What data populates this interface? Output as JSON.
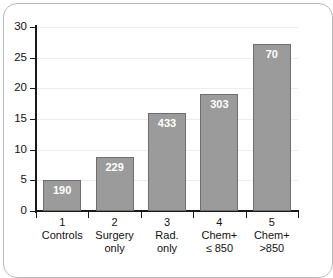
{
  "chart_data": {
    "type": "bar",
    "title": "",
    "subtitle": "",
    "xlabel": "",
    "ylabel": "",
    "ylim": [
      0,
      30
    ],
    "ytick_values": [
      0,
      5,
      10,
      15,
      20,
      25,
      30
    ],
    "ytick_labels": [
      "0",
      "5",
      "10",
      "15",
      "20",
      "25",
      "30"
    ],
    "grid": true,
    "legend": null,
    "categories": [
      {
        "number": "1",
        "line1": "Controls",
        "line2": ""
      },
      {
        "number": "2",
        "line1": "Surgery",
        "line2": "only"
      },
      {
        "number": "3",
        "line1": "Rad.",
        "line2": "only"
      },
      {
        "number": "4",
        "line1": "Chem+",
        "line2": "≤ 850"
      },
      {
        "number": "5",
        "line1": "Chem+",
        "line2": ">850"
      }
    ],
    "values": [
      5.0,
      8.8,
      16.0,
      19.0,
      27.3
    ],
    "data_labels": [
      "190",
      "229",
      "433",
      "303",
      "70"
    ],
    "bar_color": "#9b9b9b",
    "bar_edge_color": "#6e6e6e",
    "data_label_color": "#ffffff",
    "axis_color": "#1a1a1a",
    "gridline_color": "#ededed",
    "frame_color": "#b9b9b9"
  }
}
